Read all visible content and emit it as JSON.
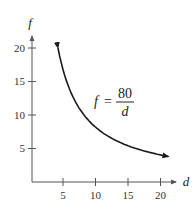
{
  "chart_data": {
    "type": "line",
    "title": "",
    "xlabel": "d",
    "ylabel": "f",
    "function": "f = 80/d",
    "annotation": {
      "lhs": "f",
      "equals": "=",
      "numerator": "80",
      "denominator": "d"
    },
    "x_ticks": [
      5,
      10,
      15,
      20
    ],
    "y_ticks": [
      5,
      10,
      15,
      20
    ],
    "xlim": [
      0,
      22
    ],
    "ylim": [
      0,
      22
    ],
    "grid": false,
    "series": [
      {
        "name": "f = 80/d",
        "x": [
          4,
          5,
          6,
          8,
          10,
          12,
          14,
          16,
          18,
          20,
          21
        ],
        "y": [
          20,
          16,
          13.33,
          10,
          8,
          6.67,
          5.71,
          5,
          4.44,
          4,
          3.81
        ]
      }
    ],
    "colors": {
      "curve": "#1a1a1a",
      "axis": "#555555"
    }
  }
}
